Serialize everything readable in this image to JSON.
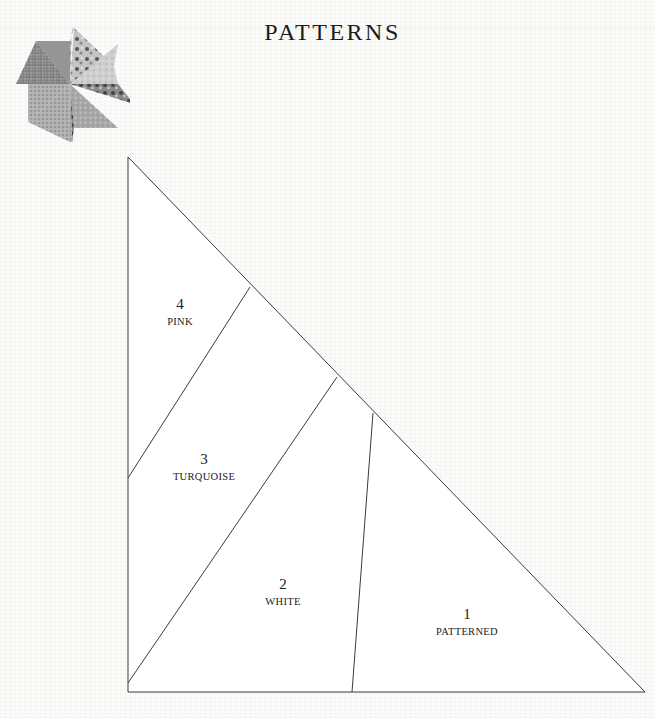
{
  "header": {
    "title": "PATTERNS",
    "logo_icon": "pinwheel-quilt-block-icon"
  },
  "pattern": {
    "shape": "right-triangle",
    "outline": {
      "apex": [
        128,
        157
      ],
      "bottom_left": [
        128,
        692
      ],
      "bottom_right": [
        645,
        692
      ]
    },
    "seams": [
      {
        "from": [
          250,
          287
        ],
        "to": [
          128,
          478
        ]
      },
      {
        "from": [
          337,
          377
        ],
        "to": [
          128,
          683
        ]
      },
      {
        "from": [
          373,
          413
        ],
        "to": [
          352,
          692
        ]
      }
    ],
    "line_color": "#3a3a3a",
    "fill_color": "#ffffff",
    "pieces": [
      {
        "number": "1",
        "color": "PATTERNED",
        "label_x": 467,
        "label_y": 606
      },
      {
        "number": "2",
        "color": "WHITE",
        "label_x": 283,
        "label_y": 576
      },
      {
        "number": "3",
        "color": "TURQUOISE",
        "label_x": 204,
        "label_y": 451
      },
      {
        "number": "4",
        "color": "PINK",
        "label_x": 180,
        "label_y": 296
      }
    ]
  }
}
